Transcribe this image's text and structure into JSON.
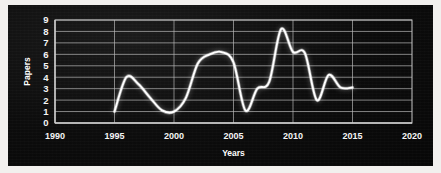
{
  "chart_data": {
    "type": "line",
    "title": "",
    "xlabel": "Years",
    "ylabel": "Papers",
    "xlim": [
      1990,
      2020
    ],
    "ylim": [
      0,
      9
    ],
    "grid": true,
    "legend": "none",
    "xticks": [
      1990,
      1995,
      2000,
      2005,
      2010,
      2015,
      2020
    ],
    "yticks": [
      0,
      1,
      2,
      3,
      4,
      5,
      6,
      7,
      8,
      9
    ],
    "series": [
      {
        "name": "Papers",
        "color": "#ffffff",
        "x": [
          1995,
          1996,
          1997,
          1998,
          1999,
          2000,
          2001,
          2002,
          2003,
          2004,
          2005,
          2006,
          2007,
          2008,
          2009,
          2010,
          2011,
          2012,
          2013,
          2014,
          2015
        ],
        "values": [
          1,
          4,
          3.4,
          2.2,
          1.1,
          1,
          2.2,
          5.2,
          6,
          6.2,
          5.3,
          1.1,
          3,
          3.6,
          8.2,
          6.2,
          6.1,
          2,
          4.2,
          3.1,
          3.1
        ]
      }
    ]
  },
  "axis_labels": {
    "x_title": "Years",
    "y_title": "Papers"
  }
}
